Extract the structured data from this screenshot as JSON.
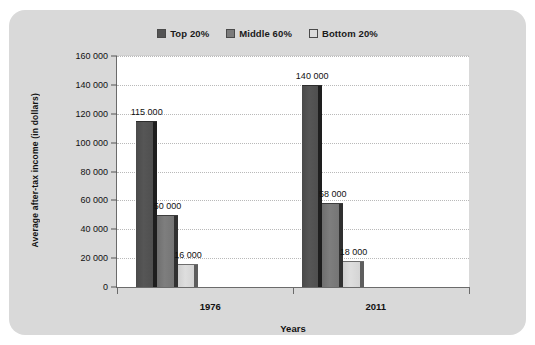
{
  "card": {
    "background": "#d9d9d9"
  },
  "legend": {
    "position": "top-center",
    "items": [
      {
        "label": "Top 20%",
        "color": "#545454",
        "icon": "legend-swatch"
      },
      {
        "label": "Middle 60%",
        "color": "#7b7b7b",
        "icon": "legend-swatch"
      },
      {
        "label": "Bottom 20%",
        "color": "#dcdcdc",
        "icon": "legend-swatch"
      }
    ]
  },
  "chart_data": {
    "type": "bar",
    "title": "",
    "xlabel": "Years",
    "ylabel": "Average after-tax income (in dollars)",
    "categories": [
      "1976",
      "2011"
    ],
    "series": [
      {
        "name": "Top 20%",
        "values": [
          115000,
          140000
        ],
        "labels": [
          "115 000",
          "140 000"
        ],
        "color": "#545454"
      },
      {
        "name": "Middle 60%",
        "values": [
          50000,
          58000
        ],
        "labels": [
          "50 000",
          "58 000"
        ],
        "color": "#7b7b7b"
      },
      {
        "name": "Bottom 20%",
        "values": [
          16000,
          18000
        ],
        "labels": [
          "16 000",
          "18 000"
        ],
        "color": "#dcdcdc"
      }
    ],
    "ylim": [
      0,
      160000
    ],
    "ytick_step": 20000,
    "ytick_labels": [
      "0",
      "20 000",
      "40 000",
      "60 000",
      "80 000",
      "100 000",
      "120 000",
      "140 000",
      "160 000"
    ],
    "ytick_values": [
      0,
      20000,
      40000,
      60000,
      80000,
      100000,
      120000,
      140000,
      160000
    ],
    "grid": "horizontal-dotted",
    "legend_position": "top-center",
    "plot_background": "#ffffff"
  }
}
